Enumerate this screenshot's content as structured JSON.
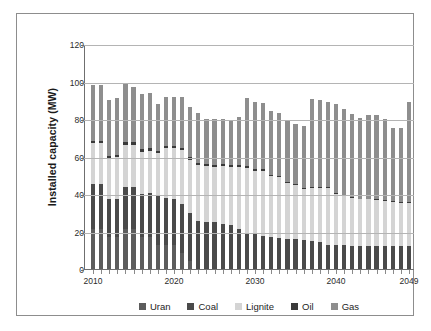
{
  "chart_data": {
    "type": "bar",
    "stacked": true,
    "title": "",
    "xlabel": "",
    "ylabel": "Installed capacity (MW)",
    "ylim": [
      0,
      120
    ],
    "yticks": [
      0,
      20,
      40,
      60,
      80,
      100,
      120
    ],
    "grid": true,
    "legend_position": "bottom",
    "x_tick_labels": [
      "2010",
      "2020",
      "2030",
      "2040",
      "2049"
    ],
    "x_tick_years": [
      2010,
      2020,
      2030,
      2040,
      2049
    ],
    "categories": [
      "2010",
      "2011",
      "2012",
      "2013",
      "2014",
      "2015",
      "2016",
      "2017",
      "2018",
      "2019",
      "2020",
      "2021",
      "2022",
      "2023",
      "2024",
      "2025",
      "2026",
      "2027",
      "2028",
      "2029",
      "2030",
      "2031",
      "2032",
      "2033",
      "2034",
      "2035",
      "2036",
      "2037",
      "2038",
      "2039",
      "2040",
      "2041",
      "2042",
      "2043",
      "2044",
      "2045",
      "2046",
      "2047",
      "2048",
      "2049"
    ],
    "series": [
      {
        "name": "Uran",
        "color": "#5c5c5c",
        "values": [
          21.5,
          21.5,
          17.0,
          17.0,
          21.5,
          21.5,
          17.0,
          17.0,
          12.8,
          12.8,
          12.8,
          8.5,
          4.2,
          0,
          0,
          0,
          0,
          0,
          0,
          0,
          0,
          0,
          0,
          0,
          0,
          0,
          0,
          0,
          0,
          0,
          0,
          0,
          0,
          0,
          0,
          0,
          0,
          0,
          0,
          0
        ]
      },
      {
        "name": "Coal",
        "color": "#4a4a4a",
        "values": [
          24.0,
          24.0,
          20.5,
          20.5,
          22.5,
          22.5,
          23.0,
          23.5,
          26.0,
          25.0,
          24.5,
          26.0,
          25.8,
          25.5,
          25.3,
          25.0,
          23.8,
          23.3,
          21.5,
          19.0,
          18.5,
          17.8,
          17.0,
          16.5,
          16.2,
          15.8,
          15.5,
          15.2,
          14.5,
          13.0,
          13.0,
          12.8,
          12.5,
          12.3,
          12.3,
          12.3,
          12.3,
          12.3,
          12.3,
          12.3
        ]
      },
      {
        "name": "Lignite",
        "color": "#d4d4d4",
        "values": [
          21.5,
          21.5,
          21.5,
          22.0,
          22.0,
          22.0,
          22.5,
          22.5,
          23.0,
          26.5,
          27.0,
          28.8,
          28.3,
          30.0,
          29.5,
          29.5,
          31.0,
          31.0,
          33.0,
          35.0,
          34.0,
          34.5,
          32.5,
          32.5,
          29.5,
          29.0,
          27.0,
          28.0,
          28.5,
          30.5,
          27.0,
          26.0,
          25.5,
          25.0,
          25.0,
          24.5,
          24.0,
          23.5,
          23.0,
          23.0
        ]
      },
      {
        "name": "Oil",
        "color": "#3a3a3a",
        "values": [
          1.5,
          1.5,
          1.5,
          1.5,
          1.5,
          1.5,
          1.5,
          1.5,
          1.2,
          1.2,
          1.2,
          1.2,
          1.2,
          1.2,
          1.0,
          1.0,
          1.0,
          1.0,
          1.0,
          1.0,
          0.8,
          0.8,
          0.8,
          0.8,
          0.8,
          0.8,
          0.5,
          0.5,
          0.5,
          0.5,
          0.3,
          0.3,
          0.3,
          0.3,
          0.3,
          0.3,
          0.3,
          0.3,
          0.3,
          0.3
        ]
      },
      {
        "name": "Gas",
        "color": "#8e8e8e",
        "values": [
          29.5,
          29.5,
          29.5,
          30.0,
          31.5,
          29.5,
          29.5,
          29.5,
          25.0,
          26.5,
          26.5,
          27.5,
          27.0,
          26.3,
          24.2,
          24.5,
          24.2,
          24.0,
          25.7,
          36.0,
          35.7,
          35.2,
          34.2,
          33.2,
          33.2,
          31.7,
          33.2,
          47.0,
          46.5,
          45.0,
          47.7,
          46.2,
          44.2,
          43.2,
          44.7,
          45.2,
          43.4,
          39.2,
          39.4,
          53.4
        ]
      }
    ]
  },
  "legend": {
    "items": [
      {
        "label": "Uran",
        "color": "#5c5c5c",
        "icon": "square-swatch-icon"
      },
      {
        "label": "Coal",
        "color": "#4a4a4a",
        "icon": "square-swatch-icon"
      },
      {
        "label": "Lignite",
        "color": "#d4d4d4",
        "icon": "square-swatch-icon"
      },
      {
        "label": "Oil",
        "color": "#3a3a3a",
        "icon": "square-swatch-icon"
      },
      {
        "label": "Gas",
        "color": "#8e8e8e",
        "icon": "square-swatch-icon"
      }
    ]
  },
  "colors": {
    "frame_border": "#8d8d8d",
    "gridline": "#b4b4b4",
    "axis": "#6f6f6f",
    "text": "#1a1a1a",
    "background": "#ffffff"
  }
}
